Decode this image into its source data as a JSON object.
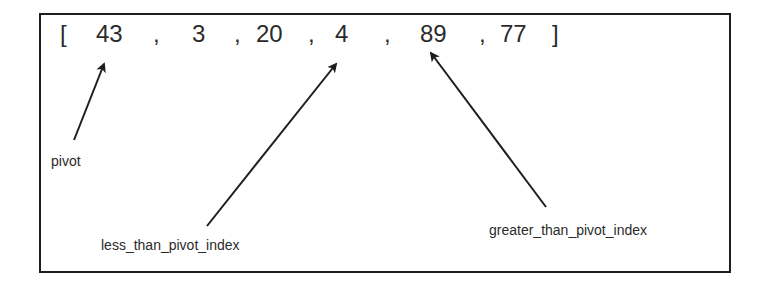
{
  "diagram": {
    "array": {
      "open_bracket": "[",
      "close_bracket": "]",
      "separator": ",",
      "values": [
        "43",
        "3",
        "20",
        "4",
        "89",
        "77"
      ]
    },
    "labels": {
      "pivot": "pivot",
      "less": "less_than_pivot_index",
      "greater": "greater_than_pivot_index"
    },
    "arrows": [
      {
        "name": "pivot",
        "points_to_value": "43",
        "from": [
          74,
          140
        ],
        "to": [
          104,
          63
        ]
      },
      {
        "name": "less_than_pivot_index",
        "points_to_value": "4",
        "from": [
          207,
          226
        ],
        "to": [
          337,
          63
        ]
      },
      {
        "name": "greater_than_pivot_index",
        "points_to_value": "89",
        "from": [
          546,
          207
        ],
        "to": [
          431,
          52
        ]
      }
    ],
    "colors": {
      "stroke": "#1e1e1e",
      "text": "#2b2b2b",
      "background": "#ffffff"
    }
  }
}
